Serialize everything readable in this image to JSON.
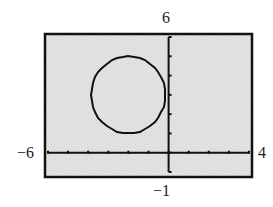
{
  "window": {
    "xmin": -6,
    "xmax": 4,
    "ymin": -1,
    "ymax": 6,
    "xscl": 1,
    "yscl": 1
  },
  "labels": {
    "ymax": "6",
    "ymin": "−1",
    "xmin": "−6",
    "xmax": "4"
  },
  "colors": {
    "screen_bg": "#e3e3e3",
    "frame": "#111111",
    "axis": "#111111",
    "curve": "#111111"
  },
  "chart_data": {
    "type": "line",
    "title": "",
    "xlabel": "",
    "ylabel": "",
    "xlim": [
      -6,
      4
    ],
    "ylim": [
      -1,
      6
    ],
    "grid": false,
    "x_ticks": [
      -6,
      -5,
      -4,
      -3,
      -2,
      -1,
      0,
      1,
      2,
      3,
      4
    ],
    "y_ticks": [
      -1,
      0,
      1,
      2,
      3,
      4,
      5,
      6
    ],
    "tick_labels": {
      "xmin": "−6",
      "xmax": "4",
      "ymin": "−1",
      "ymax": "6"
    },
    "series": [
      {
        "name": "circle",
        "equation": "(x + 2)^2 + (y - 3)^2 = 4",
        "center": [
          -2,
          3
        ],
        "radius": 2
      }
    ]
  }
}
